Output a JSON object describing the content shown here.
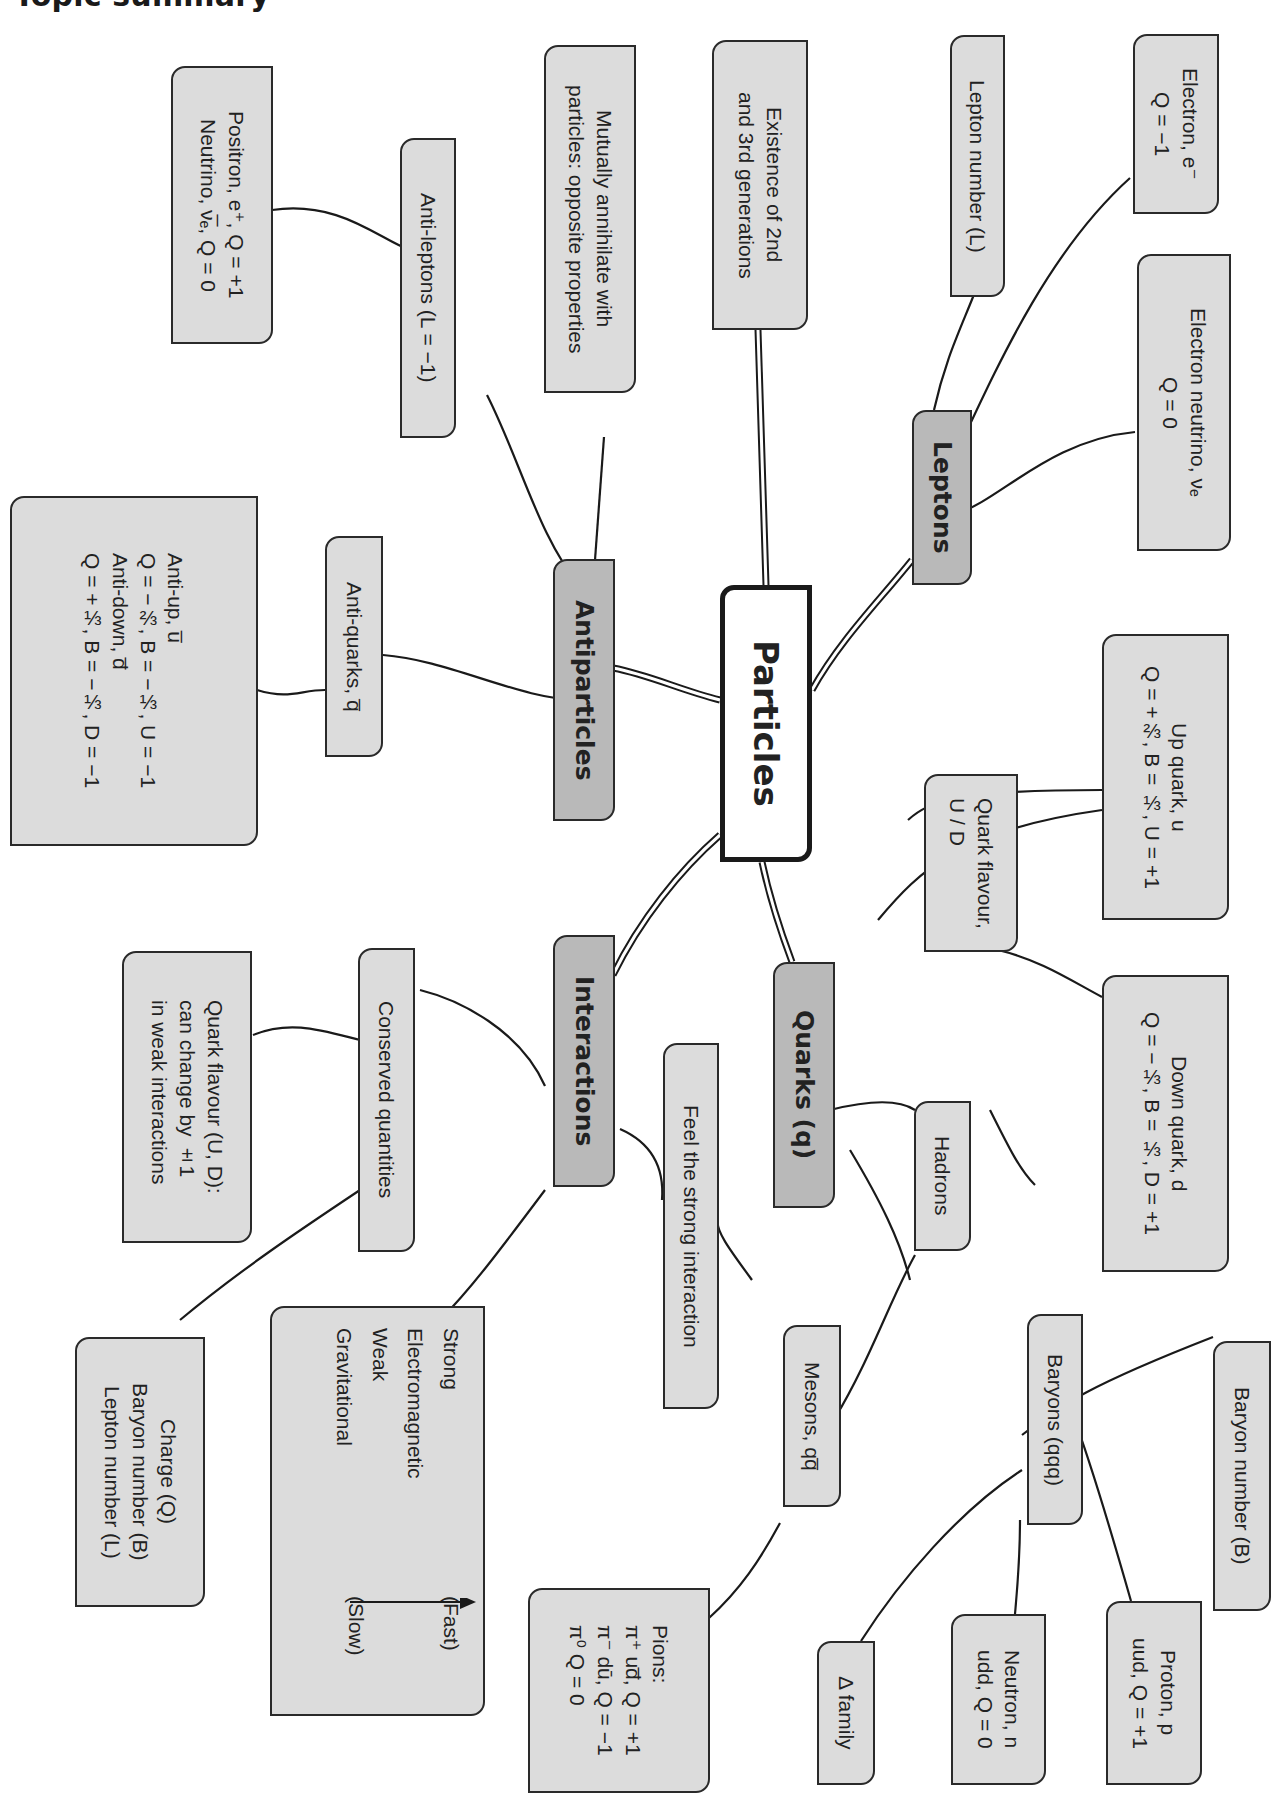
{
  "page": {
    "title": "Topic summary"
  },
  "root": {
    "label": "Particles"
  },
  "branches": {
    "leptons": {
      "label": "Leptons",
      "children": {
        "electron": "Electron, e⁻\nQ = −1",
        "electron_neutrino": "Electron neutrino, νₑ\nQ = 0",
        "lepton_number": "Lepton number (L)",
        "generations": "Existence of 2nd\nand 3rd generations"
      }
    },
    "antiparticles": {
      "label": "Antiparticles",
      "children": {
        "annihilate": "Mutually annihilate with\nparticles: opposite properties",
        "antileptons": "Anti-leptons (L = −1)",
        "positron_neutrino": "Positron, e⁺, Q = +1\nNeutrino, ν̅ₑ, Q = 0",
        "antiquarks": "Anti-quarks, q̅",
        "antiquark_details": "Anti-up, u̅\nQ = −⅔, B = −⅓, U = −1\nAnti-down, d̅\nQ = +⅓, B = −⅓, D = −1"
      }
    },
    "quarks": {
      "label": "Quarks (q)",
      "children": {
        "flavour": "Quark flavour,\nU / D",
        "up": "Up quark, u\nQ = +⅔, B = ⅓, U = +1",
        "down": "Down quark, d\nQ = −⅓, B = ⅓, D = +1",
        "strong": "Feel the strong interaction",
        "hadrons": "Hadrons",
        "baryons": "Baryons (qqq)",
        "baryon_number": "Baryon number (B)",
        "proton": "Proton, p\nuud, Q = +1",
        "neutron": "Neutron, n\nudd, Q = 0",
        "delta": "Δ family",
        "mesons": "Mesons, qq̅",
        "pions": "Pions:\nπ⁺ ud̅, Q = +1\nπ⁻ dū, Q = −1\nπ⁰ Q = 0"
      }
    },
    "interactions": {
      "label": "Interactions",
      "children": {
        "conserved": "Conserved quantities",
        "flavour_change": "Quark flavour (U, D):\ncan change by ±1\nin weak interactions",
        "conserved_list": "Charge (Q)\nBaryon number (B)\nLepton number (L)",
        "forces": [
          "Strong",
          "Electromagnetic",
          "Weak",
          "Gravitational"
        ],
        "fast_label": "(Fast)",
        "slow_label": "(Slow)"
      }
    }
  },
  "colors": {
    "root_fill": "#ffffff",
    "level1_fill": "#b9b9b9",
    "leaf_fill": "#dcdcdc",
    "border": "#2a2a2a",
    "background": "#ffffff"
  }
}
